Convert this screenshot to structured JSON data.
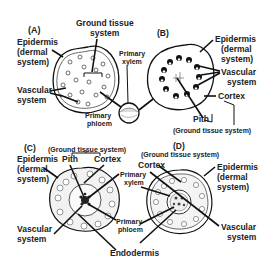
{
  "figure": {
    "panels": [
      {
        "id": "A",
        "label": "(A)",
        "labels": {
          "epidermis_1": "Epidermis",
          "epidermis_2": "(dermal",
          "epidermis_3": "system)",
          "ground_1": "Ground tissue",
          "ground_2": "system",
          "vascular_1": "Vascular",
          "vascular_2": "system",
          "xylem_1": "Primary",
          "xylem_2": "xylem",
          "phloem_1": "Primary",
          "phloem_2": "phloem"
        }
      },
      {
        "id": "B",
        "label": "(B)",
        "labels": {
          "epidermis_1": "Epidermis",
          "epidermis_2": "(dermal",
          "epidermis_3": "system)",
          "vascular_1": "Vascular",
          "vascular_2": "system",
          "cortex": "Cortex",
          "pith": "Pith",
          "ground": "(Ground tissue system)"
        }
      },
      {
        "id": "C",
        "label": "(C)",
        "labels": {
          "ground": "(Ground tissue system)",
          "epidermis_1": "Epidermis",
          "epidermis_2": "(dermal",
          "epidermis_3": "system)",
          "pith": "Pith",
          "cortex": "Cortex",
          "xylem_1": "Primary",
          "xylem_2": "xylem",
          "phloem_1": "Primary",
          "phloem_2": "phloem",
          "vascular_1": "Vascular",
          "vascular_2": "system",
          "endodermis": "Endodermis"
        }
      },
      {
        "id": "D",
        "label": "(D)",
        "labels": {
          "ground": "(Ground tissue system)",
          "cortex": "Cortex",
          "epidermis_1": "Epidermis",
          "epidermis_2": "(dermal",
          "epidermis_3": "system)",
          "vascular_1": "Vascular",
          "vascular_2": "system"
        }
      }
    ]
  }
}
